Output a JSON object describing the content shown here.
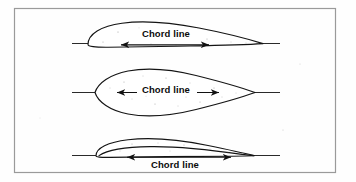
{
  "figure": {
    "background_color": "#fefefe",
    "line_color": "#141414",
    "border_color": "#9a9a9a",
    "label_color": "#0b0b0b",
    "width": 356,
    "height": 182
  },
  "border": {
    "x": 14,
    "y": 8,
    "width": 322,
    "height": 165
  },
  "diagrams": [
    {
      "id": "airfoil-top",
      "name": "cambered-airfoil",
      "label": "Chord line",
      "label_position": "above-chord",
      "chord_line": {
        "x1": 72,
        "y": 43,
        "x2": 280
      },
      "leading_edge_x": 88,
      "trailing_edge_x": 262,
      "arrow": {
        "x1": 118,
        "x2": 212,
        "y": 44
      },
      "label_xy": {
        "x": 166,
        "y": 35
      }
    },
    {
      "id": "airfoil-middle",
      "name": "symmetric-thick-airfoil",
      "label": "Chord line",
      "label_position": "on-chord",
      "chord_line": {
        "x1": 72,
        "y": 92,
        "x2": 280
      },
      "leading_edge_x": 95,
      "trailing_edge_x": 255,
      "arrow": {
        "x1": 114,
        "x2": 222,
        "y": 92
      },
      "label_xy": {
        "x": 166,
        "y": 90
      }
    },
    {
      "id": "airfoil-bottom",
      "name": "thin-highly-cambered-airfoil",
      "label": "Chord line",
      "label_position": "below-chord",
      "chord_line": {
        "x1": 72,
        "y": 155,
        "x2": 280
      },
      "leading_edge_x": 96,
      "trailing_edge_x": 254,
      "arrow": {
        "x1": 124,
        "x2": 234,
        "y": 157
      },
      "label_xy": {
        "x": 175,
        "y": 166
      }
    }
  ]
}
